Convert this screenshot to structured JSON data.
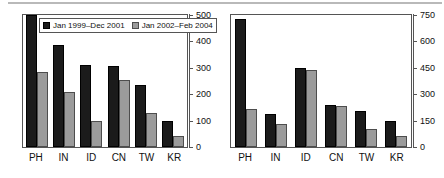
{
  "legend": {
    "position": "top-left-inside-left-panel",
    "entries": [
      {
        "label": "Jan 1999–Dec 2001",
        "color": "#1b1b1b"
      },
      {
        "label": "Jan 2002–Feb 2004",
        "color": "#9b9b9b"
      }
    ]
  },
  "chart_data": [
    {
      "type": "bar",
      "title": "",
      "xlabel": "",
      "ylabel": "",
      "categories": [
        "PH",
        "IN",
        "ID",
        "CN",
        "TW",
        "KR"
      ],
      "series": [
        {
          "name": "Jan 1999–Dec 2001",
          "color": "#1b1b1b",
          "values": [
            500,
            385,
            310,
            305,
            235,
            100
          ]
        },
        {
          "name": "Jan 2002–Feb 2004",
          "color": "#9b9b9b",
          "values": [
            285,
            208,
            100,
            255,
            128,
            40
          ]
        }
      ],
      "ylim": [
        0,
        500
      ],
      "yticks": [
        0,
        100,
        200,
        300,
        400,
        500
      ],
      "ytick_labels": [
        "0",
        "100",
        "200",
        "300",
        "400",
        "500"
      ],
      "axis_position": "right",
      "grid": false,
      "legend_position": "upper-left-inside"
    },
    {
      "type": "bar",
      "title": "",
      "xlabel": "",
      "ylabel": "",
      "categories": [
        "PH",
        "IN",
        "ID",
        "CN",
        "TW",
        "KR"
      ],
      "series": [
        {
          "name": "Jan 1999–Dec 2001",
          "color": "#1b1b1b",
          "values": [
            725,
            190,
            450,
            240,
            205,
            150
          ]
        },
        {
          "name": "Jan 2002–Feb 2004",
          "color": "#9b9b9b",
          "values": [
            215,
            130,
            435,
            235,
            105,
            60
          ]
        }
      ],
      "ylim": [
        0,
        750
      ],
      "yticks": [
        0,
        150,
        300,
        450,
        600,
        750
      ],
      "ytick_labels": [
        "0",
        "150",
        "300",
        "450",
        "600",
        "750"
      ],
      "axis_position": "right",
      "grid": false,
      "legend_position": "none"
    }
  ]
}
